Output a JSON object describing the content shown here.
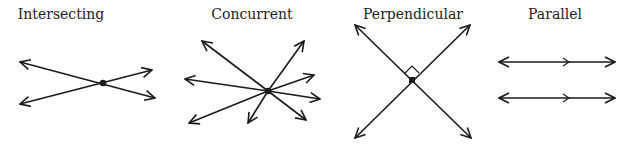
{
  "panels": [
    {
      "id": "intersecting",
      "title": "Intersecting",
      "title_x": 61
    },
    {
      "id": "concurrent",
      "title": "Concurrent",
      "title_x": 252
    },
    {
      "id": "perpendicular",
      "title": "Perpendicular",
      "title_x": 413
    },
    {
      "id": "parallel",
      "title": "Parallel",
      "title_x": 555
    }
  ],
  "colors": {
    "stroke": "#1a1a1a",
    "background": "#ffffff"
  }
}
